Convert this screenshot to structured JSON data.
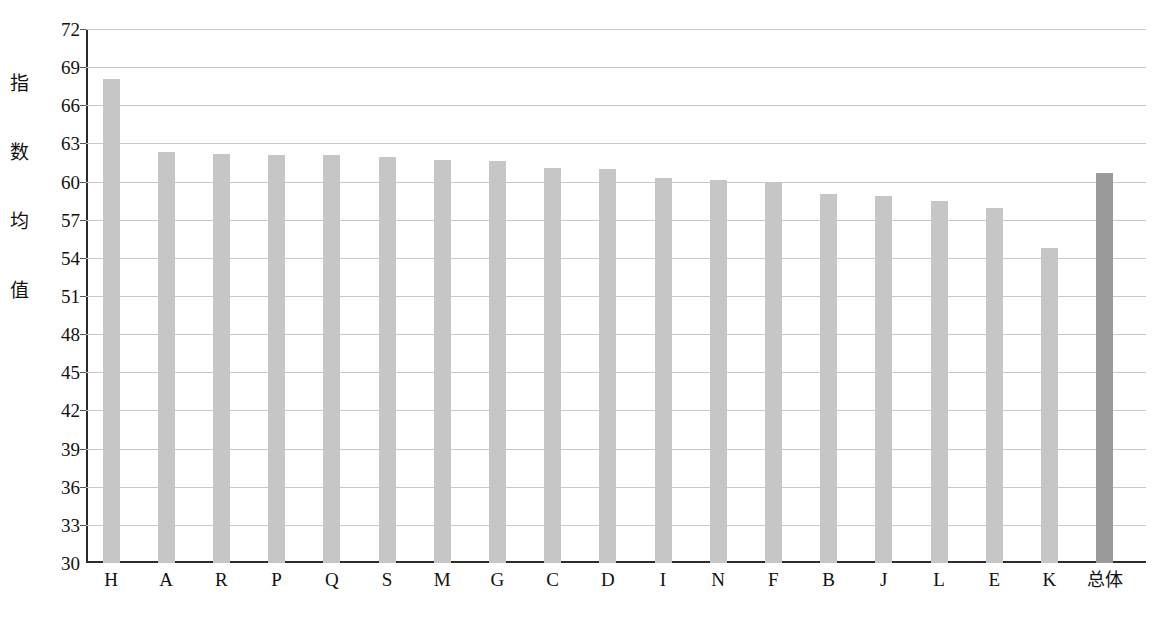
{
  "chart_data": {
    "type": "bar",
    "title": "",
    "xlabel": "",
    "ylabel": "指数均值",
    "ylim": [
      30,
      72
    ],
    "ytick_step": 3,
    "yticks": [
      72,
      69,
      66,
      63,
      60,
      57,
      54,
      51,
      48,
      45,
      42,
      39,
      36,
      33,
      30
    ],
    "grid": true,
    "legend": "none",
    "categories": [
      "H",
      "A",
      "R",
      "P",
      "Q",
      "S",
      "M",
      "G",
      "C",
      "D",
      "I",
      "N",
      "F",
      "B",
      "J",
      "L",
      "E",
      "K",
      "总体"
    ],
    "values": [
      68.1,
      62.3,
      62.2,
      62.1,
      62.1,
      61.9,
      61.7,
      61.6,
      61.1,
      61.0,
      60.3,
      60.1,
      60.0,
      59.0,
      58.9,
      58.5,
      57.9,
      54.8,
      60.7
    ],
    "bar_colors": [
      "#c6c6c6",
      "#c6c6c6",
      "#c6c6c6",
      "#c6c6c6",
      "#c6c6c6",
      "#c6c6c6",
      "#c6c6c6",
      "#c6c6c6",
      "#c6c6c6",
      "#c6c6c6",
      "#c6c6c6",
      "#c6c6c6",
      "#c6c6c6",
      "#c6c6c6",
      "#c6c6c6",
      "#c6c6c6",
      "#c6c6c6",
      "#c6c6c6",
      "#9a9a9a"
    ],
    "highlight_category": "总体",
    "colors": {
      "bar": "#c6c6c6",
      "bar_highlight": "#9a9a9a",
      "grid": "#c9c9c9",
      "axis": "#2b2b2b",
      "text": "#111111",
      "background": "#ffffff"
    }
  },
  "axis": {
    "y_title_chars": [
      "指",
      "数",
      "均",
      "值"
    ]
  }
}
